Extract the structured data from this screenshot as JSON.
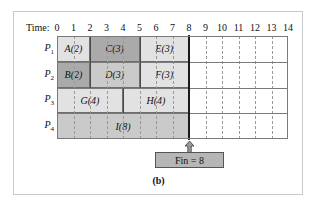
{
  "figure": {
    "caption": "(b)",
    "time_axis_label": "Time:",
    "tick_labels": [
      "0",
      "1",
      "2",
      "3",
      "4",
      "5",
      "6",
      "7",
      "8",
      "9",
      "10",
      "11",
      "12",
      "13",
      "14"
    ],
    "row_labels": [
      {
        "name": "P",
        "sub": "1"
      },
      {
        "name": "P",
        "sub": "2"
      },
      {
        "name": "P",
        "sub": "3"
      },
      {
        "name": "P",
        "sub": "4"
      }
    ],
    "finish_marker": {
      "label": "Fin = 8",
      "time": 8
    },
    "colors": {
      "light": "#e2e2e2",
      "medium": "#cacaca",
      "dark": "#aaaaaa",
      "fin_box": "#b6b6b6",
      "grid_line": "#7a7a7a",
      "dashed_line": "#9a9a9a",
      "fin_line": "#1a1a1a",
      "frame": "#c9c9c9",
      "background": "#ffffff"
    }
  },
  "chart_data": {
    "type": "bar",
    "title": "(b)",
    "xlabel": "Time:",
    "ylabel": "",
    "xlim": [
      0,
      14
    ],
    "grid": true,
    "legend": "none",
    "orientation": "horizontal",
    "categories": [
      "P1",
      "P2",
      "P3",
      "P4"
    ],
    "xticks": [
      0,
      1,
      2,
      3,
      4,
      5,
      6,
      7,
      8,
      9,
      10,
      11,
      12,
      13,
      14
    ],
    "annotations": [
      {
        "text": "Fin = 8",
        "x": 8,
        "type": "finish-line"
      }
    ],
    "series": [
      {
        "name": "P1",
        "row": 0,
        "tasks": [
          {
            "label": "A(2)",
            "task": "A",
            "duration": 2,
            "start": 0,
            "end": 2,
            "shade": "light"
          },
          {
            "label": "C(3)",
            "task": "C",
            "duration": 3,
            "start": 2,
            "end": 5,
            "shade": "dark"
          },
          {
            "label": "E(3)",
            "task": "E",
            "duration": 3,
            "start": 5,
            "end": 8,
            "shade": "light"
          }
        ]
      },
      {
        "name": "P2",
        "row": 1,
        "tasks": [
          {
            "label": "B(2)",
            "task": "B",
            "duration": 2,
            "start": 0,
            "end": 2,
            "shade": "dark"
          },
          {
            "label": "D(3)",
            "task": "D",
            "duration": 3,
            "start": 2,
            "end": 5,
            "shade": "medium"
          },
          {
            "label": "F(3)",
            "task": "F",
            "duration": 3,
            "start": 5,
            "end": 8,
            "shade": "light"
          }
        ]
      },
      {
        "name": "P3",
        "row": 2,
        "tasks": [
          {
            "label": "G(4)",
            "task": "G",
            "duration": 4,
            "start": 0,
            "end": 4,
            "shade": "light"
          },
          {
            "label": "H(4)",
            "task": "H",
            "duration": 4,
            "start": 4,
            "end": 8,
            "shade": "light"
          }
        ]
      },
      {
        "name": "P4",
        "row": 3,
        "tasks": [
          {
            "label": "I(8)",
            "task": "I",
            "duration": 8,
            "start": 0,
            "end": 8,
            "shade": "medium"
          }
        ]
      }
    ]
  }
}
